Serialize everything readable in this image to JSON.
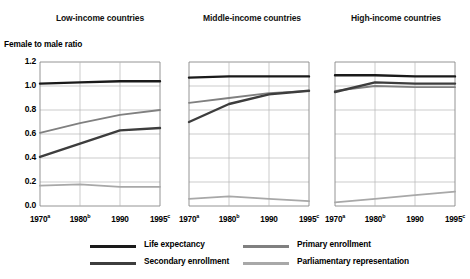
{
  "figure": {
    "y_caption": "Female to male ratio",
    "panel_titles": {
      "low": "Low-income countries",
      "middle": "Middle-income countries",
      "high": "High-income countries"
    }
  },
  "axes": {
    "y_ticks": [
      "1.2",
      "1.0",
      "0.8",
      "0.6",
      "0.4",
      "0.2",
      "0.0"
    ],
    "x_ticks": [
      {
        "year": "1970",
        "note": "a"
      },
      {
        "year": "1980",
        "note": "b"
      },
      {
        "year": "1990",
        "note": ""
      },
      {
        "year": "1995",
        "note": "c"
      }
    ]
  },
  "legend": {
    "items": [
      {
        "label": "Life expectancy",
        "color": "#1a1a1a"
      },
      {
        "label": "Secondary enrollment",
        "color": "#3d3d3d"
      },
      {
        "label": "Primary enrollment",
        "color": "#808080"
      },
      {
        "label": "Parliamentary representation",
        "color": "#a8a8a8"
      }
    ]
  },
  "chart_data": {
    "type": "line",
    "xlabel": "",
    "ylabel": "Female to male ratio",
    "ylim": [
      0.0,
      1.2
    ],
    "grid": true,
    "legend_position": "bottom",
    "x": [
      1970,
      1980,
      1990,
      1995
    ],
    "x_tick_labels": [
      "1970a",
      "1980b",
      "1990",
      "1995c"
    ],
    "panels": [
      {
        "name": "Low-income countries",
        "series": [
          {
            "name": "Life expectancy",
            "color": "#1a1a1a",
            "values": [
              1.02,
              1.03,
              1.04,
              1.04
            ]
          },
          {
            "name": "Primary enrollment",
            "color": "#808080",
            "values": [
              0.61,
              0.69,
              0.76,
              0.8
            ]
          },
          {
            "name": "Secondary enrollment",
            "color": "#3d3d3d",
            "values": [
              0.41,
              0.52,
              0.63,
              0.65
            ]
          },
          {
            "name": "Parliamentary representation",
            "color": "#a8a8a8",
            "values": [
              0.17,
              0.18,
              0.16,
              0.16
            ]
          }
        ]
      },
      {
        "name": "Middle-income countries",
        "series": [
          {
            "name": "Life expectancy",
            "color": "#1a1a1a",
            "values": [
              1.07,
              1.08,
              1.08,
              1.08
            ]
          },
          {
            "name": "Primary enrollment",
            "color": "#808080",
            "values": [
              0.86,
              0.9,
              0.94,
              0.96
            ]
          },
          {
            "name": "Secondary enrollment",
            "color": "#3d3d3d",
            "values": [
              0.7,
              0.85,
              0.93,
              0.96
            ]
          },
          {
            "name": "Parliamentary representation",
            "color": "#a8a8a8",
            "values": [
              0.06,
              0.08,
              0.06,
              0.04
            ]
          }
        ]
      },
      {
        "name": "High-income countries",
        "series": [
          {
            "name": "Life expectancy",
            "color": "#1a1a1a",
            "values": [
              1.09,
              1.09,
              1.08,
              1.08
            ]
          },
          {
            "name": "Primary enrollment",
            "color": "#808080",
            "values": [
              0.96,
              1.0,
              0.99,
              0.99
            ]
          },
          {
            "name": "Secondary enrollment",
            "color": "#3d3d3d",
            "values": [
              0.95,
              1.03,
              1.02,
              1.02
            ]
          },
          {
            "name": "Parliamentary representation",
            "color": "#a8a8a8",
            "values": [
              0.03,
              0.06,
              0.09,
              0.12
            ]
          }
        ]
      }
    ]
  }
}
